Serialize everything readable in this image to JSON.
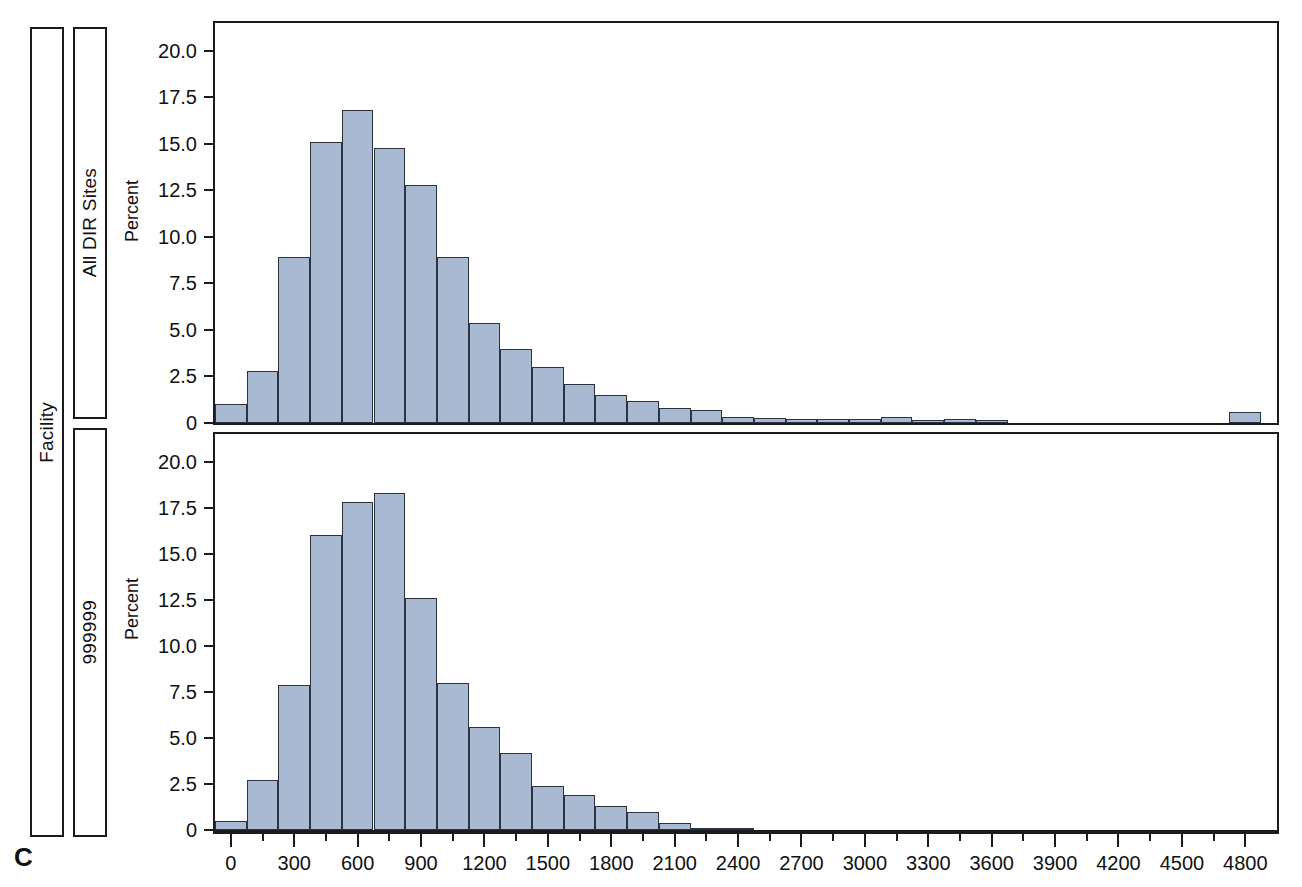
{
  "figure": {
    "panel_letter": "C",
    "outer_strip_label": "Facility",
    "bar_fill_color": "#a9b9d1",
    "bar_edge_color": "#2a3440"
  },
  "panels": [
    {
      "strip_label": "All DIR Sites",
      "ylabel": "Percent"
    },
    {
      "strip_label": "999999",
      "ylabel": "Percent"
    }
  ],
  "axis": {
    "y_ticks": [
      "0",
      "2.5",
      "5.0",
      "7.5",
      "10.0",
      "12.5",
      "15.0",
      "17.5",
      "20.0"
    ],
    "x_ticks": [
      "0",
      "300",
      "600",
      "900",
      "1200",
      "1500",
      "1800",
      "2100",
      "2400",
      "2700",
      "3000",
      "3300",
      "3600",
      "3900",
      "4200",
      "4500",
      "4800"
    ]
  },
  "chart_data": [
    {
      "type": "bar",
      "title": "",
      "subtitle": "All DIR Sites",
      "xlabel": "",
      "ylabel": "Percent",
      "ylim": [
        0,
        21.5
      ],
      "xlim": [
        -75,
        4950
      ],
      "grid": false,
      "legend": "none",
      "bin_width": 150,
      "bin_starts": [
        -75,
        75,
        225,
        375,
        525,
        675,
        825,
        975,
        1125,
        1275,
        1425,
        1575,
        1725,
        1875,
        2025,
        2175,
        2325,
        2475,
        2625,
        2775,
        2925,
        3075,
        3225,
        3375,
        3525,
        4725
      ],
      "categories": [
        "0",
        "150",
        "300",
        "450",
        "600",
        "750",
        "900",
        "1050",
        "1200",
        "1350",
        "1500",
        "1650",
        "1800",
        "1950",
        "2100",
        "2250",
        "2400",
        "2550",
        "2700",
        "2850",
        "3000",
        "3150",
        "3300",
        "3450",
        "3600",
        "4800"
      ],
      "values": [
        1.0,
        2.8,
        8.9,
        15.1,
        16.8,
        14.8,
        12.8,
        8.9,
        5.4,
        4.0,
        3.0,
        2.1,
        1.5,
        1.2,
        0.8,
        0.7,
        0.3,
        0.25,
        0.2,
        0.2,
        0.2,
        0.3,
        0.15,
        0.2,
        0.15,
        0.6
      ]
    },
    {
      "type": "bar",
      "title": "",
      "subtitle": "999999",
      "xlabel": "",
      "ylabel": "Percent",
      "ylim": [
        0,
        21.5
      ],
      "xlim": [
        -75,
        4950
      ],
      "grid": false,
      "legend": "none",
      "bin_width": 150,
      "bin_starts": [
        -75,
        75,
        225,
        375,
        525,
        675,
        825,
        975,
        1125,
        1275,
        1425,
        1575,
        1725,
        1875,
        2025,
        2175,
        2325
      ],
      "categories": [
        "0",
        "150",
        "300",
        "450",
        "600",
        "750",
        "900",
        "1050",
        "1200",
        "1350",
        "1500",
        "1650",
        "1800",
        "1950",
        "2100",
        "2250",
        "2400"
      ],
      "values": [
        0.5,
        2.7,
        7.9,
        16.0,
        17.8,
        18.3,
        12.6,
        8.0,
        5.6,
        4.2,
        2.4,
        1.9,
        1.3,
        1.0,
        0.4,
        0.12,
        0.08
      ]
    }
  ]
}
